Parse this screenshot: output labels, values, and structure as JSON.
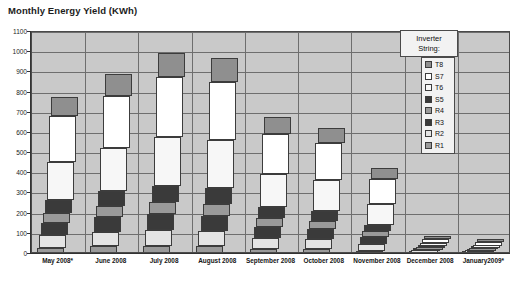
{
  "chart_data": {
    "type": "bar",
    "subtype": "stacked-column",
    "title": "Monthly Energy Yield (KWh)",
    "xlabel": "",
    "ylabel": "",
    "ylim": [
      0,
      1100
    ],
    "ytick_step": 100,
    "yticks": [
      0,
      100,
      200,
      300,
      400,
      500,
      600,
      700,
      800,
      900,
      1000,
      1100
    ],
    "grid": true,
    "legend_position": "inside-top-right",
    "legend_title": "Inverter String:",
    "categories": [
      "May 2008*",
      "June 2008",
      "July 2008",
      "August 2008",
      "September 2008",
      "October 2008",
      "November 2008",
      "December 2008",
      "January2009*"
    ],
    "series": [
      {
        "name": "R1",
        "color": "#9a9a9a",
        "values": [
          30,
          38,
          40,
          38,
          26,
          24,
          16,
          4,
          3
        ]
      },
      {
        "name": "R2",
        "color": "#e4e4e4",
        "values": [
          62,
          72,
          78,
          76,
          54,
          50,
          34,
          9,
          7
        ]
      },
      {
        "name": "R3",
        "color": "#3a3a3a",
        "values": [
          62,
          72,
          78,
          76,
          54,
          50,
          34,
          9,
          7
        ]
      },
      {
        "name": "R4",
        "color": "#9a9a9a",
        "values": [
          50,
          58,
          62,
          60,
          44,
          40,
          28,
          7,
          6
        ]
      },
      {
        "name": "S5",
        "color": "#3a3a3a",
        "values": [
          62,
          72,
          78,
          76,
          54,
          50,
          34,
          9,
          7
        ]
      },
      {
        "name": "T6",
        "color": "#f7f7f7",
        "values": [
          190,
          215,
          246,
          240,
          166,
          152,
          103,
          16,
          12
        ]
      },
      {
        "name": "S7",
        "color": "#ffffff",
        "values": [
          226,
          258,
          295,
          288,
          199,
          183,
          124,
          19,
          15
        ]
      },
      {
        "name": "T8",
        "color": "#8f8f8f",
        "values": [
          98,
          105,
          118,
          116,
          83,
          76,
          52,
          8,
          6
        ]
      }
    ],
    "totals": [
      780,
      890,
      995,
      970,
      680,
      625,
      425,
      81,
      63
    ]
  },
  "legend": {
    "title_line1": "Inverter",
    "title_line2": "String:",
    "items": [
      {
        "label": "T8",
        "color": "#8f8f8f"
      },
      {
        "label": "S7",
        "color": "#ffffff"
      },
      {
        "label": "T6",
        "color": "#f7f7f7"
      },
      {
        "label": "S5",
        "color": "#3a3a3a"
      },
      {
        "label": "R4",
        "color": "#9a9a9a"
      },
      {
        "label": "R3",
        "color": "#3a3a3a"
      },
      {
        "label": "R2",
        "color": "#e4e4e4"
      },
      {
        "label": "R1",
        "color": "#9a9a9a"
      }
    ]
  },
  "colors": {
    "plot_background": "#c9c9c9",
    "gridline": "#6e6e6e",
    "axis": "#333333",
    "text": "#141414"
  }
}
